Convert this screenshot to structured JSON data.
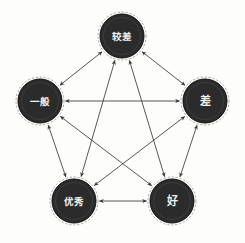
{
  "figure": {
    "title": "",
    "background_color": "#fdfdfc",
    "node_fill_color": "#2b2b2b",
    "node_text_color": "#f2f2ef",
    "edge_color": "#3a3a3a"
  },
  "chart_data": {
    "type": "diagram",
    "diagram_type": "directed-graph",
    "title": "",
    "layout": "pentagon",
    "grid": false,
    "legend": "none",
    "node_count": 5,
    "edge_count": 10,
    "nodes": [
      {
        "id": "jiaocha",
        "label": "较差",
        "x": 122,
        "y": 36,
        "r": 24,
        "position": "top"
      },
      {
        "id": "yiban",
        "label": "一般",
        "x": 40,
        "y": 101,
        "r": 24,
        "position": "left"
      },
      {
        "id": "cha",
        "label": "差",
        "x": 205,
        "y": 101,
        "r": 24,
        "position": "right"
      },
      {
        "id": "youxiu",
        "label": "优秀",
        "x": 74,
        "y": 201,
        "r": 24,
        "position": "bottom-left"
      },
      {
        "id": "hao",
        "label": "好",
        "x": 172,
        "y": 201,
        "r": 24,
        "position": "bottom-right"
      }
    ],
    "edges": [
      {
        "from": "yiban",
        "to": "jiaocha",
        "direction": "both"
      },
      {
        "from": "jiaocha",
        "to": "cha",
        "direction": "both"
      },
      {
        "from": "yiban",
        "to": "cha",
        "direction": "both"
      },
      {
        "from": "yiban",
        "to": "youxiu",
        "direction": "both"
      },
      {
        "from": "cha",
        "to": "hao",
        "direction": "both"
      },
      {
        "from": "youxiu",
        "to": "hao",
        "direction": "both"
      },
      {
        "from": "youxiu",
        "to": "jiaocha",
        "direction": "both"
      },
      {
        "from": "hao",
        "to": "jiaocha",
        "direction": "both"
      },
      {
        "from": "youxiu",
        "to": "cha",
        "direction": "both"
      },
      {
        "from": "yiban",
        "to": "hao",
        "direction": "both"
      }
    ]
  }
}
